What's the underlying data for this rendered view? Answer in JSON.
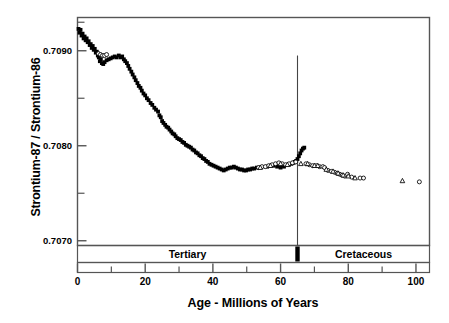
{
  "chart_data": {
    "type": "scatter",
    "title": "",
    "xlabel": "Age - Millions of Years",
    "ylabel": "Strontium-87 / Strontium-86",
    "xlim": [
      0,
      104
    ],
    "ylim": [
      0.70695,
      0.70935
    ],
    "grid": false,
    "legend_position": "none",
    "x_major_ticks": [
      0,
      20,
      40,
      60,
      80,
      100
    ],
    "x_major_tick_labels": [
      "0",
      "20",
      "40",
      "60",
      "80",
      "100"
    ],
    "x_minor_ticks": [
      10,
      30,
      50,
      70,
      90
    ],
    "y_major_ticks": [
      0.707,
      0.708,
      0.709
    ],
    "y_major_tick_labels": [
      "0.7070",
      "0.7080",
      "0.7090"
    ],
    "y_minor_ticks": [
      0.7075,
      0.7085,
      0.7093
    ],
    "annotations": [
      {
        "name": "kt-boundary-line",
        "x": 65,
        "y_top": 0.70895,
        "y_bottom": 0.707,
        "label": ""
      }
    ],
    "era_band": {
      "rows": [
        {
          "label": "Tertiary",
          "start": 0,
          "end": 65
        },
        {
          "label": "Cretaceous",
          "start": 65,
          "end": 104
        }
      ],
      "boundary_marker_x": 65
    },
    "series": [
      {
        "name": "Tertiary seawater (filled squares)",
        "marker": "filled-square",
        "color": "#000000",
        "points": [
          [
            0.3,
            0.70923
          ],
          [
            0.6,
            0.70919
          ],
          [
            0.9,
            0.70922
          ],
          [
            1.2,
            0.70916
          ],
          [
            1.5,
            0.70918
          ],
          [
            1.8,
            0.70913
          ],
          [
            2.1,
            0.70915
          ],
          [
            2.4,
            0.70911
          ],
          [
            2.7,
            0.70913
          ],
          [
            3.0,
            0.70909
          ],
          [
            3.3,
            0.7091
          ],
          [
            3.6,
            0.70906
          ],
          [
            3.9,
            0.70907
          ],
          [
            4.2,
            0.70903
          ],
          [
            4.5,
            0.70905
          ],
          [
            4.8,
            0.70901
          ],
          [
            5.1,
            0.70902
          ],
          [
            5.4,
            0.70898
          ],
          [
            5.7,
            0.70899
          ],
          [
            6.0,
            0.70895
          ],
          [
            6.3,
            0.70893
          ],
          [
            6.6,
            0.70889
          ],
          [
            6.9,
            0.70891
          ],
          [
            7.2,
            0.70887
          ],
          [
            7.6,
            0.70886
          ],
          [
            8.0,
            0.70888
          ],
          [
            8.6,
            0.7089
          ],
          [
            9.2,
            0.70891
          ],
          [
            9.8,
            0.70892
          ],
          [
            10.4,
            0.70893
          ],
          [
            11.0,
            0.70894
          ],
          [
            11.6,
            0.70893
          ],
          [
            12.2,
            0.70895
          ],
          [
            12.8,
            0.70893
          ],
          [
            13.2,
            0.70894
          ],
          [
            13.7,
            0.70891
          ],
          [
            14.1,
            0.70889
          ],
          [
            14.6,
            0.70887
          ],
          [
            15.0,
            0.70884
          ],
          [
            15.4,
            0.70881
          ],
          [
            15.9,
            0.70878
          ],
          [
            16.3,
            0.70875
          ],
          [
            16.8,
            0.70872
          ],
          [
            17.2,
            0.70869
          ],
          [
            17.7,
            0.70866
          ],
          [
            18.1,
            0.70863
          ],
          [
            18.6,
            0.70861
          ],
          [
            19.0,
            0.70858
          ],
          [
            19.5,
            0.70855
          ],
          [
            20.0,
            0.70853
          ],
          [
            20.5,
            0.7085
          ],
          [
            21.0,
            0.70848
          ],
          [
            21.6,
            0.70845
          ],
          [
            22.1,
            0.70843
          ],
          [
            22.7,
            0.7084
          ],
          [
            23.2,
            0.70838
          ],
          [
            23.8,
            0.70836
          ],
          [
            24.2,
            0.70832
          ],
          [
            24.6,
            0.7083
          ],
          [
            25.0,
            0.70826
          ],
          [
            25.4,
            0.70824
          ],
          [
            25.9,
            0.70822
          ],
          [
            26.3,
            0.7082
          ],
          [
            26.8,
            0.70819
          ],
          [
            27.2,
            0.70817
          ],
          [
            27.7,
            0.70815
          ],
          [
            28.1,
            0.70813
          ],
          [
            28.6,
            0.70812
          ],
          [
            29.0,
            0.7081
          ],
          [
            29.5,
            0.70808
          ],
          [
            30.0,
            0.70807
          ],
          [
            30.5,
            0.70806
          ],
          [
            31.0,
            0.70804
          ],
          [
            31.5,
            0.70803
          ],
          [
            32.0,
            0.70801
          ],
          [
            32.5,
            0.708
          ],
          [
            33.0,
            0.70799
          ],
          [
            33.5,
            0.70798
          ],
          [
            34.0,
            0.70796
          ],
          [
            34.5,
            0.70795
          ],
          [
            35.0,
            0.70793
          ],
          [
            35.5,
            0.70792
          ],
          [
            36.0,
            0.7079
          ],
          [
            36.5,
            0.70789
          ],
          [
            37.0,
            0.70787
          ],
          [
            37.5,
            0.70786
          ],
          [
            38.0,
            0.70784
          ],
          [
            38.5,
            0.70783
          ],
          [
            39.0,
            0.70781
          ],
          [
            39.6,
            0.7078
          ],
          [
            40.2,
            0.70779
          ],
          [
            40.8,
            0.70778
          ],
          [
            41.4,
            0.70777
          ],
          [
            42.0,
            0.70776
          ],
          [
            42.6,
            0.70775
          ],
          [
            43.2,
            0.70774
          ],
          [
            43.8,
            0.70775
          ],
          [
            44.4,
            0.70776
          ],
          [
            45.0,
            0.70777
          ],
          [
            45.6,
            0.70777
          ],
          [
            46.2,
            0.70778
          ],
          [
            46.8,
            0.70777
          ],
          [
            47.4,
            0.70776
          ],
          [
            48.0,
            0.70775
          ],
          [
            48.6,
            0.70775
          ],
          [
            49.2,
            0.70774
          ],
          [
            49.8,
            0.70774
          ],
          [
            50.4,
            0.70775
          ],
          [
            51.0,
            0.70775
          ],
          [
            51.6,
            0.70776
          ],
          [
            52.2,
            0.70776
          ],
          [
            53.0,
            0.70777
          ],
          [
            53.8,
            0.70777
          ],
          [
            56.0,
            0.70778
          ],
          [
            58.0,
            0.70779
          ],
          [
            59.0,
            0.70778
          ],
          [
            60.0,
            0.70777
          ],
          [
            61.0,
            0.70778
          ],
          [
            62.5,
            0.7078
          ],
          [
            63.2,
            0.70781
          ],
          [
            63.8,
            0.70782
          ],
          [
            64.2,
            0.70783
          ],
          [
            64.6,
            0.70784
          ],
          [
            65.0,
            0.70786
          ],
          [
            65.4,
            0.70789
          ],
          [
            65.8,
            0.70792
          ],
          [
            66.2,
            0.70795
          ],
          [
            66.6,
            0.70797
          ],
          [
            67.0,
            0.70798
          ]
        ]
      },
      {
        "name": "Open circle samples",
        "marker": "open-circle",
        "color": "#000000",
        "points": [
          [
            6.2,
            0.70897
          ],
          [
            6.8,
            0.70896
          ],
          [
            7.4,
            0.70895
          ],
          [
            8.0,
            0.70895
          ],
          [
            8.6,
            0.70896
          ],
          [
            53.5,
            0.70777
          ],
          [
            54.5,
            0.70778
          ],
          [
            55.5,
            0.70778
          ],
          [
            56.5,
            0.70779
          ],
          [
            57.5,
            0.7078
          ],
          [
            58.5,
            0.70781
          ],
          [
            59.5,
            0.70782
          ],
          [
            60.5,
            0.70781
          ],
          [
            61.5,
            0.7078
          ],
          [
            62.5,
            0.70781
          ],
          [
            63.5,
            0.70782
          ],
          [
            64.5,
            0.70783
          ],
          [
            67.5,
            0.70781
          ],
          [
            68.5,
            0.7078
          ],
          [
            69.5,
            0.70779
          ],
          [
            70.5,
            0.70779
          ],
          [
            71.5,
            0.70778
          ],
          [
            72.5,
            0.70778
          ],
          [
            73.0,
            0.70777
          ],
          [
            74.0,
            0.70774
          ],
          [
            75.0,
            0.70773
          ],
          [
            76.0,
            0.70772
          ],
          [
            76.8,
            0.70771
          ],
          [
            77.5,
            0.7077
          ],
          [
            78.2,
            0.70769
          ],
          [
            79.0,
            0.70768
          ],
          [
            79.8,
            0.7077
          ],
          [
            81.0,
            0.70767
          ],
          [
            83.5,
            0.70766
          ],
          [
            84.5,
            0.70766
          ],
          [
            101.0,
            0.70762
          ]
        ]
      },
      {
        "name": "Open triangle samples",
        "marker": "open-triangle",
        "color": "#000000",
        "points": [
          [
            54.0,
            0.70777
          ],
          [
            57.0,
            0.70779
          ],
          [
            60.0,
            0.70781
          ],
          [
            62.0,
            0.7078
          ],
          [
            66.0,
            0.70781
          ],
          [
            68.0,
            0.70781
          ],
          [
            70.0,
            0.70779
          ],
          [
            71.0,
            0.70779
          ],
          [
            73.5,
            0.70775
          ],
          [
            75.5,
            0.70773
          ],
          [
            77.0,
            0.70771
          ],
          [
            78.5,
            0.70769
          ],
          [
            80.0,
            0.70768
          ],
          [
            82.0,
            0.70766
          ],
          [
            96.0,
            0.70763
          ]
        ]
      }
    ]
  }
}
